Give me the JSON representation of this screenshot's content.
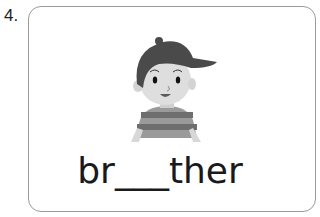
{
  "item": {
    "number": "4.",
    "word_prefix": "br",
    "blank": "___",
    "word_suffix": "ther",
    "image": "boy-with-cap-icon"
  },
  "colors": {
    "border": "#9a9a9a",
    "text": "#1a1a1a",
    "cap": "#4a4a4a",
    "skin": "#dcdcdc",
    "shirt_dark": "#6e6e6e",
    "shirt_light": "#b8b8b8"
  }
}
